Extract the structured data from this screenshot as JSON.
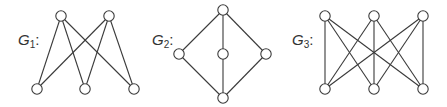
{
  "style": {
    "stroke": "#3a3a3a",
    "node_fill": "#ffffff",
    "node_radius": 5.2,
    "stroke_width": 1.1
  },
  "graphs": [
    {
      "id": "G1",
      "label": {
        "letter": "G",
        "sub": "1",
        "x": 18,
        "y": 32
      },
      "nodes": [
        {
          "id": "a",
          "x": 61,
          "y": 16
        },
        {
          "id": "b",
          "x": 109,
          "y": 16
        },
        {
          "id": "c",
          "x": 37,
          "y": 89
        },
        {
          "id": "d",
          "x": 85,
          "y": 89
        },
        {
          "id": "e",
          "x": 134,
          "y": 89
        }
      ],
      "edges": [
        [
          "a",
          "c"
        ],
        [
          "a",
          "d"
        ],
        [
          "a",
          "e"
        ],
        [
          "b",
          "c"
        ],
        [
          "b",
          "d"
        ],
        [
          "b",
          "e"
        ]
      ]
    },
    {
      "id": "G2",
      "label": {
        "letter": "G",
        "sub": "2",
        "x": 152,
        "y": 32
      },
      "nodes": [
        {
          "id": "t",
          "x": 223,
          "y": 10
        },
        {
          "id": "l",
          "x": 179,
          "y": 54
        },
        {
          "id": "m",
          "x": 223,
          "y": 54
        },
        {
          "id": "r",
          "x": 266,
          "y": 54
        },
        {
          "id": "bt",
          "x": 223,
          "y": 98
        }
      ],
      "edges": [
        [
          "t",
          "l"
        ],
        [
          "t",
          "m"
        ],
        [
          "t",
          "r"
        ],
        [
          "l",
          "bt"
        ],
        [
          "m",
          "bt"
        ],
        [
          "r",
          "bt"
        ]
      ]
    },
    {
      "id": "G3",
      "label": {
        "letter": "G",
        "sub": "3",
        "x": 292,
        "y": 32
      },
      "nodes": [
        {
          "id": "u1",
          "x": 325,
          "y": 16
        },
        {
          "id": "u2",
          "x": 374,
          "y": 16
        },
        {
          "id": "u3",
          "x": 423,
          "y": 16
        },
        {
          "id": "v1",
          "x": 325,
          "y": 89
        },
        {
          "id": "v2",
          "x": 374,
          "y": 89
        },
        {
          "id": "v3",
          "x": 423,
          "y": 89
        }
      ],
      "edges": [
        [
          "u1",
          "v1"
        ],
        [
          "u1",
          "v2"
        ],
        [
          "u1",
          "v3"
        ],
        [
          "u2",
          "v1"
        ],
        [
          "u2",
          "v2"
        ],
        [
          "u2",
          "v3"
        ],
        [
          "u3",
          "v1"
        ],
        [
          "u3",
          "v2"
        ],
        [
          "u3",
          "v3"
        ]
      ]
    }
  ]
}
